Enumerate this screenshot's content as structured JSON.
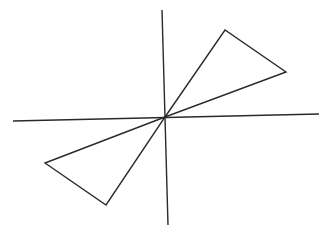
{
  "diagram": {
    "background": "#ffffff",
    "stroke_color": "#2a2a2a",
    "axes": {
      "vertical": {
        "x1": 162,
        "y1": 10,
        "x2": 168,
        "y2": 225
      },
      "horizontal": {
        "x1": 13,
        "y1": 121,
        "x2": 319,
        "y2": 114
      }
    },
    "origin": {
      "x": 165,
      "y": 117
    },
    "triangles": [
      {
        "name": "upper-right-triangle",
        "points": "165,117 225,30 286,72"
      },
      {
        "name": "lower-left-triangle",
        "points": "165,117 45,163 106,205"
      }
    ]
  }
}
